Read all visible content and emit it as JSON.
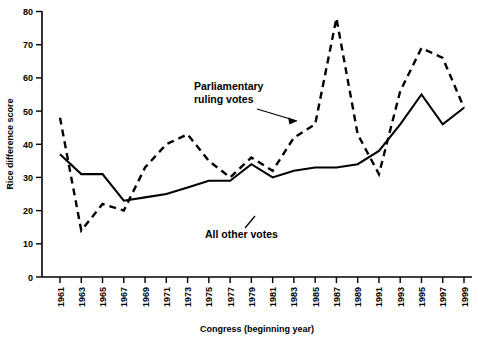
{
  "chart_data": {
    "type": "line",
    "title": "",
    "xlabel": "Congress (beginning year)",
    "ylabel": "Rice difference score",
    "xlim": [
      1961,
      1999
    ],
    "ylim": [
      0,
      80
    ],
    "yticks": [
      0,
      10,
      20,
      30,
      40,
      50,
      60,
      70,
      80
    ],
    "grid": false,
    "legend": "none",
    "x": [
      1961,
      1963,
      1965,
      1967,
      1969,
      1971,
      1973,
      1975,
      1977,
      1979,
      1981,
      1983,
      1985,
      1987,
      1989,
      1991,
      1993,
      1995,
      1997,
      1999
    ],
    "categories": [
      "1961",
      "1963",
      "1965",
      "1967",
      "1969",
      "1971",
      "1973",
      "1975",
      "1977",
      "1979",
      "1981",
      "1983",
      "1985",
      "1987",
      "1989",
      "1991",
      "1993",
      "1995",
      "1997",
      "1999"
    ],
    "series": [
      {
        "name": "Parliamentary ruling votes",
        "style": "dashed",
        "values": [
          48,
          14,
          22,
          20,
          33,
          40,
          43,
          35,
          30,
          36,
          32,
          42,
          46,
          78,
          43,
          31,
          56,
          69,
          66,
          51
        ]
      },
      {
        "name": "All other votes",
        "style": "solid",
        "values": [
          37,
          31,
          31,
          23,
          24,
          25,
          27,
          29,
          29,
          34,
          30,
          32,
          33,
          33,
          34,
          38,
          46,
          55,
          46,
          51
        ]
      }
    ],
    "annotations": [
      {
        "id": "parliamentary-ruling-votes",
        "line1": "Parliamentary",
        "line2": "ruling votes",
        "text": "Parliamentary ruling votes"
      },
      {
        "id": "all-other-votes",
        "line1": "All other votes",
        "line2": "",
        "text": "All other votes"
      }
    ]
  }
}
